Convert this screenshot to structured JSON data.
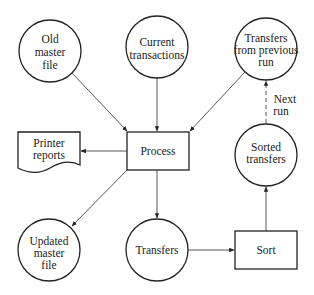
{
  "diagram": {
    "type": "system-flowchart",
    "nodes": {
      "old_master": {
        "shape": "circle",
        "lines": [
          "Old",
          "master",
          "file"
        ]
      },
      "current_transactions": {
        "shape": "circle",
        "lines": [
          "Current",
          "transactions"
        ]
      },
      "transfers_prev": {
        "shape": "circle",
        "lines": [
          "Transfers",
          "from previous",
          "run"
        ]
      },
      "printer_reports": {
        "shape": "document",
        "lines": [
          "Printer",
          "reports"
        ]
      },
      "process": {
        "shape": "rectangle",
        "lines": [
          "Process"
        ]
      },
      "sorted_transfers": {
        "shape": "circle",
        "lines": [
          "Sorted",
          "transfers"
        ]
      },
      "updated_master": {
        "shape": "circle",
        "lines": [
          "Updated",
          "master",
          "file"
        ]
      },
      "transfers": {
        "shape": "circle",
        "lines": [
          "Transfers"
        ]
      },
      "sort": {
        "shape": "rectangle",
        "lines": [
          "Sort"
        ]
      }
    },
    "edges": [
      {
        "from": "old_master",
        "to": "process",
        "style": "solid"
      },
      {
        "from": "current_transactions",
        "to": "process",
        "style": "solid"
      },
      {
        "from": "transfers_prev",
        "to": "process",
        "style": "solid"
      },
      {
        "from": "process",
        "to": "printer_reports",
        "style": "solid"
      },
      {
        "from": "process",
        "to": "updated_master",
        "style": "solid"
      },
      {
        "from": "process",
        "to": "transfers",
        "style": "solid"
      },
      {
        "from": "transfers",
        "to": "sort",
        "style": "solid"
      },
      {
        "from": "sort",
        "to": "sorted_transfers",
        "style": "solid"
      },
      {
        "from": "sorted_transfers",
        "to": "transfers_prev",
        "style": "dashed",
        "label": [
          "Next",
          "run"
        ]
      }
    ]
  }
}
